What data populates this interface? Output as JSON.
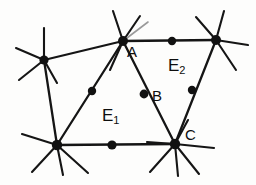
{
  "figure": {
    "kind": "hand-drawn-graph-diagram",
    "background_color": "#fdfdfc",
    "ink_color": "#151515",
    "width": 256,
    "height": 185,
    "point_labels": [
      {
        "id": "A",
        "text": "A",
        "x": 127,
        "y": 44
      },
      {
        "id": "B",
        "text": "B",
        "x": 152,
        "y": 88
      },
      {
        "id": "C",
        "text": "C",
        "x": 185,
        "y": 127
      }
    ],
    "region_labels": [
      {
        "id": "E1",
        "base": "E",
        "sub": "1",
        "x": 102,
        "y": 107
      },
      {
        "id": "E2",
        "base": "E",
        "sub": "2",
        "x": 168,
        "y": 57
      }
    ],
    "vertices": [
      {
        "id": "top-left-vertex",
        "x": 44,
        "y": 60,
        "r": 4.6
      },
      {
        "id": "vertex-a",
        "x": 123,
        "y": 41,
        "r": 5.0
      },
      {
        "id": "top-right-vertex",
        "x": 216,
        "y": 40,
        "r": 5.0
      },
      {
        "id": "bottom-left-vertex",
        "x": 57,
        "y": 145,
        "r": 5.2
      },
      {
        "id": "vertex-c",
        "x": 175,
        "y": 144,
        "r": 5.2
      }
    ],
    "midpoints": [
      {
        "id": "midpoint-top-edge",
        "x": 172,
        "y": 41,
        "r": 4.2
      },
      {
        "id": "midpoint-left-diagonal",
        "x": 92,
        "y": 91,
        "r": 4.2
      },
      {
        "id": "midpoint-b",
        "x": 144,
        "y": 94,
        "r": 4.4
      },
      {
        "id": "midpoint-right-edge",
        "x": 192,
        "y": 90,
        "r": 4.2
      },
      {
        "id": "midpoint-bottom-edge",
        "x": 112,
        "y": 145,
        "r": 4.6
      }
    ],
    "edges": [
      {
        "id": "edge-topleft-to-a",
        "x1": 44,
        "y1": 60,
        "x2": 123,
        "y2": 41
      },
      {
        "id": "edge-a-to-topright",
        "x1": 123,
        "y1": 41,
        "x2": 216,
        "y2": 40
      },
      {
        "id": "edge-topleft-to-bottomleft",
        "x1": 44,
        "y1": 60,
        "x2": 57,
        "y2": 145
      },
      {
        "id": "edge-bottomleft-to-a",
        "x1": 57,
        "y1": 145,
        "x2": 123,
        "y2": 41
      },
      {
        "id": "edge-a-to-c",
        "x1": 123,
        "y1": 41,
        "x2": 175,
        "y2": 144
      },
      {
        "id": "edge-bottomleft-to-c",
        "x1": 57,
        "y1": 145,
        "x2": 175,
        "y2": 144
      },
      {
        "id": "edge-topright-to-c",
        "x1": 216,
        "y1": 40,
        "x2": 175,
        "y2": 144
      }
    ],
    "stubs": [
      {
        "id": "stub-topleft-up",
        "x1": 44,
        "y1": 60,
        "x2": 44,
        "y2": 28,
        "faint": false
      },
      {
        "id": "stub-topleft-left",
        "x1": 44,
        "y1": 60,
        "x2": 16,
        "y2": 48,
        "faint": false
      },
      {
        "id": "stub-topleft-downleft",
        "x1": 44,
        "y1": 60,
        "x2": 19,
        "y2": 80,
        "faint": false
      },
      {
        "id": "stub-topleft-downright",
        "x1": 44,
        "y1": 60,
        "x2": 57,
        "y2": 83,
        "faint": false
      },
      {
        "id": "stub-a-up",
        "x1": 123,
        "y1": 41,
        "x2": 113,
        "y2": 11,
        "faint": false
      },
      {
        "id": "stub-a-upright",
        "x1": 123,
        "y1": 41,
        "x2": 140,
        "y2": 16,
        "faint": false
      },
      {
        "id": "stub-a-upright-faint",
        "x1": 123,
        "y1": 41,
        "x2": 148,
        "y2": 22,
        "faint": true
      },
      {
        "id": "stub-a-down",
        "x1": 123,
        "y1": 41,
        "x2": 110,
        "y2": 70,
        "faint": false
      },
      {
        "id": "stub-topright-up",
        "x1": 216,
        "y1": 40,
        "x2": 224,
        "y2": 11,
        "faint": false
      },
      {
        "id": "stub-topright-right",
        "x1": 216,
        "y1": 40,
        "x2": 248,
        "y2": 45,
        "faint": false
      },
      {
        "id": "stub-topright-upleft",
        "x1": 216,
        "y1": 40,
        "x2": 196,
        "y2": 17,
        "faint": false
      },
      {
        "id": "stub-topright-downright",
        "x1": 216,
        "y1": 40,
        "x2": 236,
        "y2": 70,
        "faint": false
      },
      {
        "id": "stub-bottomleft-left",
        "x1": 57,
        "y1": 145,
        "x2": 22,
        "y2": 134,
        "faint": false
      },
      {
        "id": "stub-bottomleft-downleft",
        "x1": 57,
        "y1": 145,
        "x2": 32,
        "y2": 172,
        "faint": false
      },
      {
        "id": "stub-bottomleft-down",
        "x1": 57,
        "y1": 145,
        "x2": 63,
        "y2": 175,
        "faint": false
      },
      {
        "id": "stub-bottomleft-downright",
        "x1": 57,
        "y1": 145,
        "x2": 88,
        "y2": 173,
        "faint": false
      },
      {
        "id": "stub-c-left",
        "x1": 175,
        "y1": 144,
        "x2": 147,
        "y2": 142,
        "faint": false
      },
      {
        "id": "stub-c-right",
        "x1": 175,
        "y1": 144,
        "x2": 214,
        "y2": 148,
        "faint": false
      },
      {
        "id": "stub-c-downleft",
        "x1": 175,
        "y1": 144,
        "x2": 150,
        "y2": 172,
        "faint": false
      },
      {
        "id": "stub-c-down",
        "x1": 175,
        "y1": 144,
        "x2": 178,
        "y2": 176,
        "faint": false
      },
      {
        "id": "stub-c-downright",
        "x1": 175,
        "y1": 144,
        "x2": 199,
        "y2": 174,
        "faint": false
      },
      {
        "id": "stub-c-upright",
        "x1": 175,
        "y1": 144,
        "x2": 188,
        "y2": 120,
        "faint": false
      }
    ]
  }
}
